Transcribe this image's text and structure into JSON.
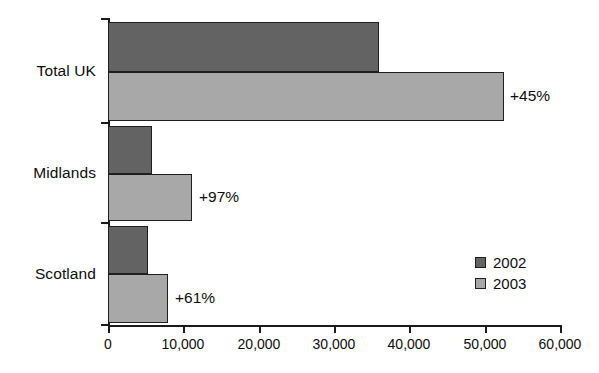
{
  "chart_data": {
    "type": "bar",
    "orientation": "horizontal",
    "title": "",
    "xlabel": "",
    "ylabel": "",
    "categories": [
      "Total UK",
      "Midlands",
      "Scotland"
    ],
    "series": [
      {
        "name": "2002",
        "color": "#636363",
        "values": [
          36000,
          5800,
          5300
        ]
      },
      {
        "name": "2003",
        "color": "#a8a8a8",
        "values": [
          52500,
          11100,
          8000
        ]
      }
    ],
    "annotations": [
      "+45%",
      "+97%",
      "+61%"
    ],
    "xlim": [
      0,
      60000
    ],
    "xticks": [
      0,
      10000,
      20000,
      30000,
      40000,
      50000,
      60000
    ],
    "xtick_labels": [
      "0",
      "10,000",
      "20,000",
      "30,000",
      "40,000",
      "50,000",
      "60,000"
    ],
    "grid": false,
    "legend_position": "bottom-right"
  },
  "legend": {
    "items": [
      {
        "label": "2002",
        "color": "#636363"
      },
      {
        "label": "2003",
        "color": "#a8a8a8"
      }
    ]
  }
}
